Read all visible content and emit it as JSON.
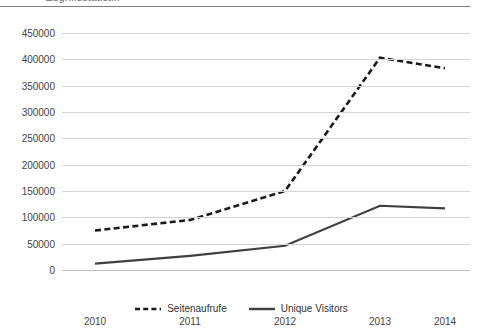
{
  "header": {
    "clipped_title": "Zugriffsstatistik",
    "rule_color": "#7d7d7d"
  },
  "legend": {
    "position": "bottom-center",
    "entries": [
      {
        "label": "Seitenaufrufe",
        "style": "dashed",
        "color": "#1a1a1a",
        "icon": "dashed-line-swatch"
      },
      {
        "label": "Unique Visitors",
        "style": "solid",
        "color": "#3f3f3f",
        "icon": "solid-line-swatch"
      }
    ]
  },
  "axes": {
    "y_ticks": [
      "450000",
      "400000",
      "350000",
      "300000",
      "250000",
      "200000",
      "150000",
      "100000",
      "50000",
      "0"
    ],
    "x_ticks": [
      "2010",
      "2011",
      "2012",
      "2013",
      "2014"
    ]
  },
  "chart_data": {
    "type": "line",
    "title": "",
    "xlabel": "",
    "ylabel": "",
    "categories": [
      "2010",
      "2011",
      "2012",
      "2013",
      "2014"
    ],
    "x": [
      2010,
      2011,
      2012,
      2013,
      2014
    ],
    "ylim": [
      0,
      450000
    ],
    "ytick_step": 50000,
    "grid": true,
    "legend_position": "bottom-center",
    "series": [
      {
        "name": "Seitenaufrufe",
        "style": "dashed",
        "color": "#1a1a1a",
        "values": [
          75000,
          95000,
          150000,
          403000,
          383000
        ]
      },
      {
        "name": "Unique Visitors",
        "style": "solid",
        "color": "#3f3f3f",
        "values": [
          12000,
          27000,
          46000,
          122000,
          117000
        ]
      }
    ]
  }
}
